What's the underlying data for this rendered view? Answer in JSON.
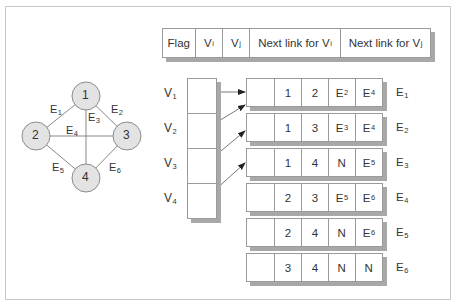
{
  "header": {
    "fields": [
      {
        "main": "Flag",
        "sub": ""
      },
      {
        "main": "V",
        "sub": "i"
      },
      {
        "main": "V",
        "sub": "j"
      },
      {
        "main": "Next link for V",
        "sub": "i"
      },
      {
        "main": "Next link for V",
        "sub": "j"
      }
    ]
  },
  "graph": {
    "nodes": [
      {
        "id": "1",
        "label": "1"
      },
      {
        "id": "2",
        "label": "2"
      },
      {
        "id": "3",
        "label": "3"
      },
      {
        "id": "4",
        "label": "4"
      }
    ],
    "edges": [
      {
        "name": "E",
        "sub": "1",
        "from": "1",
        "to": "2"
      },
      {
        "name": "E",
        "sub": "2",
        "from": "1",
        "to": "3"
      },
      {
        "name": "E",
        "sub": "3",
        "from": "1",
        "to": "4"
      },
      {
        "name": "E",
        "sub": "4",
        "from": "2",
        "to": "3"
      },
      {
        "name": "E",
        "sub": "5",
        "from": "2",
        "to": "4"
      },
      {
        "name": "E",
        "sub": "6",
        "from": "3",
        "to": "4"
      }
    ]
  },
  "vertex_list": [
    {
      "name": "V",
      "sub": "1"
    },
    {
      "name": "V",
      "sub": "2"
    },
    {
      "name": "V",
      "sub": "3"
    },
    {
      "name": "V",
      "sub": "4"
    }
  ],
  "edge_records": [
    {
      "label": {
        "main": "E",
        "sub": "1"
      },
      "flag": "",
      "vi": "1",
      "vj": "2",
      "next_i": {
        "main": "E",
        "sub": "2"
      },
      "next_j": {
        "main": "E",
        "sub": "4"
      }
    },
    {
      "label": {
        "main": "E",
        "sub": "2"
      },
      "flag": "",
      "vi": "1",
      "vj": "3",
      "next_i": {
        "main": "E",
        "sub": "3"
      },
      "next_j": {
        "main": "E",
        "sub": "4"
      }
    },
    {
      "label": {
        "main": "E",
        "sub": "3"
      },
      "flag": "",
      "vi": "1",
      "vj": "4",
      "next_i": {
        "main": "N",
        "sub": ""
      },
      "next_j": {
        "main": "E",
        "sub": "5"
      }
    },
    {
      "label": {
        "main": "E",
        "sub": "4"
      },
      "flag": "",
      "vi": "2",
      "vj": "3",
      "next_i": {
        "main": "E",
        "sub": "5"
      },
      "next_j": {
        "main": "E",
        "sub": "6"
      }
    },
    {
      "label": {
        "main": "E",
        "sub": "5"
      },
      "flag": "",
      "vi": "2",
      "vj": "4",
      "next_i": {
        "main": "N",
        "sub": ""
      },
      "next_j": {
        "main": "E",
        "sub": "6"
      }
    },
    {
      "label": {
        "main": "E",
        "sub": "6"
      },
      "flag": "",
      "vi": "3",
      "vj": "4",
      "next_i": {
        "main": "N",
        "sub": ""
      },
      "next_j": {
        "main": "N",
        "sub": ""
      }
    }
  ],
  "colors": {
    "node_fill": "#e3e3e3",
    "node_stroke": "#8c8c8c",
    "line": "#7a7a7a",
    "shadow": "#a8a8a8",
    "border": "#9a9a9a"
  }
}
